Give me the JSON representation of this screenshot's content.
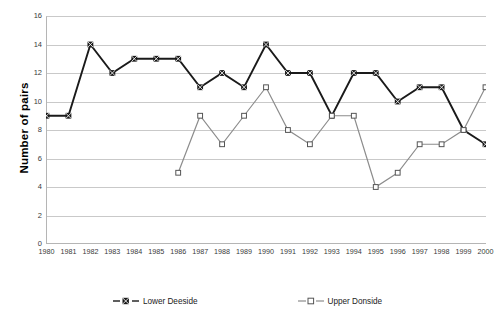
{
  "chart_data": {
    "type": "line",
    "title": "",
    "xlabel": "Year",
    "ylabel": "Number of pairs",
    "x": [
      1980,
      1981,
      1982,
      1983,
      1984,
      1985,
      1986,
      1987,
      1988,
      1989,
      1990,
      1991,
      1992,
      1993,
      1994,
      1995,
      1996,
      1997,
      1998,
      1999,
      2000
    ],
    "xticklabels": [
      "1980",
      "1981",
      "1982",
      "1983",
      "1984",
      "1985",
      "1986",
      "1987",
      "1988",
      "1989",
      "1990",
      "1991",
      "1992",
      "1993",
      "1994",
      "1995",
      "1996",
      "1997",
      "1998",
      "1999",
      "2000"
    ],
    "yticklabels": [
      "0",
      "2",
      "4",
      "6",
      "8",
      "10",
      "12",
      "14",
      "16"
    ],
    "ytickvalues": [
      0,
      2,
      4,
      6,
      8,
      10,
      12,
      14,
      16
    ],
    "ylim": [
      0,
      16
    ],
    "xlim": [
      1980,
      2000
    ],
    "grid": "horizontal",
    "legend_position": "bottom",
    "series": [
      {
        "name": "Lower Deeside",
        "color": "#1a1a1a",
        "marker": "x-square",
        "values": [
          9,
          9,
          14,
          12,
          13,
          13,
          13,
          11,
          12,
          11,
          14,
          12,
          12,
          9,
          12,
          12,
          10,
          11,
          11,
          8,
          7
        ]
      },
      {
        "name": "Upper Donside",
        "color": "#8c8c8c",
        "marker": "open-square",
        "values": [
          null,
          null,
          null,
          null,
          null,
          null,
          5,
          9,
          7,
          9,
          11,
          8,
          7,
          9,
          9,
          4,
          5,
          7,
          7,
          8,
          11
        ]
      }
    ]
  },
  "legend": {
    "entries": [
      {
        "label": "Lower Deeside"
      },
      {
        "label": "Upper Donside"
      }
    ]
  },
  "axes": {
    "y_title": "Number of pairs",
    "x_title": "Year"
  },
  "colors": {
    "series_dark": "#1a1a1a",
    "series_gray": "#8c8c8c",
    "gridline": "#c9c9c9",
    "axis": "#b5b5b5",
    "background": "#ffffff"
  }
}
